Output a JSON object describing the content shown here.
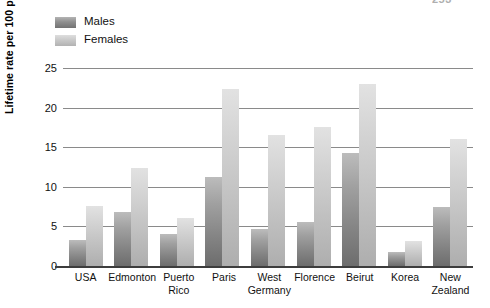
{
  "page": {
    "page_number_artifact": "253"
  },
  "legend": {
    "items": [
      {
        "label": "Males",
        "color": "#8f8f8f",
        "key": "males"
      },
      {
        "label": "Females",
        "color": "#c9c9c9",
        "key": "females"
      }
    ]
  },
  "axes": {
    "y_title": "Lifetime rate per 100 people",
    "y_ticks": [
      "0",
      "5",
      "10",
      "15",
      "20",
      "25"
    ]
  },
  "chart_data": {
    "type": "bar",
    "title": "",
    "xlabel": "",
    "ylabel": "Lifetime rate per 100 people",
    "ylim": [
      0,
      25
    ],
    "yticks": [
      0,
      5,
      10,
      15,
      20,
      25
    ],
    "grid": true,
    "legend_position": "top-left",
    "categories": [
      "USA",
      "Edmonton",
      "Puerto Rico",
      "Paris",
      "West Germany",
      "Florence",
      "Beirut",
      "Korea",
      "New Zealand"
    ],
    "category_lines": [
      [
        "USA"
      ],
      [
        "Edmonton"
      ],
      [
        "Puerto",
        "Rico"
      ],
      [
        "Paris"
      ],
      [
        "West",
        "Germany"
      ],
      [
        "Florence"
      ],
      [
        "Beirut"
      ],
      [
        "Korea"
      ],
      [
        "New",
        "Zealand"
      ]
    ],
    "series": [
      {
        "name": "Males",
        "color": "#8f8f8f",
        "values": [
          3.3,
          6.8,
          4.0,
          11.2,
          4.7,
          5.6,
          14.3,
          1.8,
          7.4
        ]
      },
      {
        "name": "Females",
        "color": "#c9c9c9",
        "values": [
          7.6,
          12.4,
          6.0,
          22.3,
          16.6,
          17.5,
          23.0,
          3.2,
          16.0
        ]
      }
    ]
  }
}
